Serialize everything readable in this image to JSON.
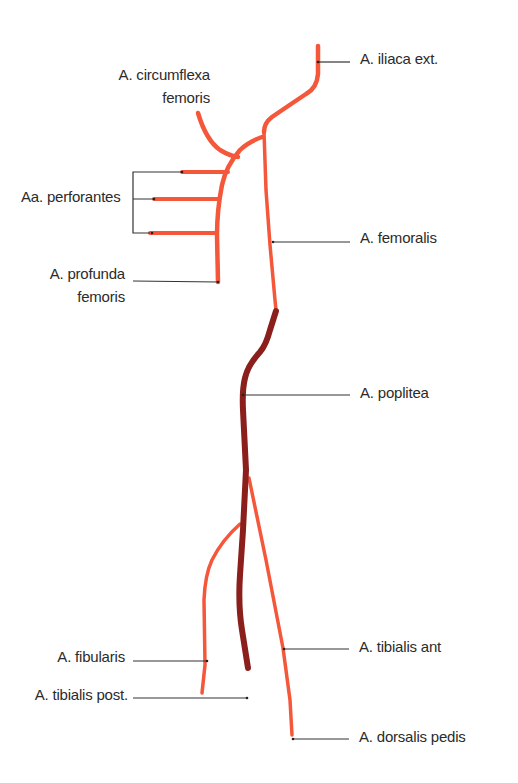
{
  "diagram": {
    "colors": {
      "artery": "#f4573a",
      "popliteal": "#8a1f1c",
      "leader": "#333333",
      "text": "#2b2b2b",
      "background": "#ffffff"
    },
    "labels": {
      "iliaca_ext": "A. iliaca ext.",
      "circumflexa_line1": "A. circumflexa",
      "circumflexa_line2": "femoris",
      "perforantes": "Aa. perforantes",
      "femoralis": "A. femoralis",
      "profunda_line1": "A. profunda",
      "profunda_line2": "femoris",
      "poplitea": "A. poplitea",
      "tibialis_ant": "A. tibialis ant",
      "fibularis": "A. fibularis",
      "tibialis_post": "A. tibialis post.",
      "dorsalis_pedis": "A. dorsalis pedis"
    }
  }
}
